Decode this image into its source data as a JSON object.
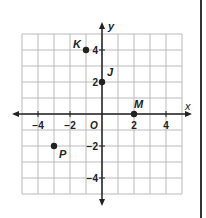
{
  "chart_data": {
    "type": "scatter",
    "title": "",
    "xlabel": "x",
    "ylabel": "y",
    "xlim": [
      -5,
      5
    ],
    "ylim": [
      -5,
      5
    ],
    "grid": true,
    "x_ticks": [
      -4,
      -2,
      2,
      4
    ],
    "y_ticks": [
      4,
      2,
      -2,
      -4
    ],
    "origin_label": "O",
    "points": [
      {
        "label": "K",
        "x": -1,
        "y": 4
      },
      {
        "label": "J",
        "x": 0,
        "y": 2
      },
      {
        "label": "M",
        "x": 2,
        "y": 0
      },
      {
        "label": "P",
        "x": -3,
        "y": -2
      }
    ]
  },
  "colors": {
    "ink": "#222222",
    "grid": "#bbbbbb"
  }
}
